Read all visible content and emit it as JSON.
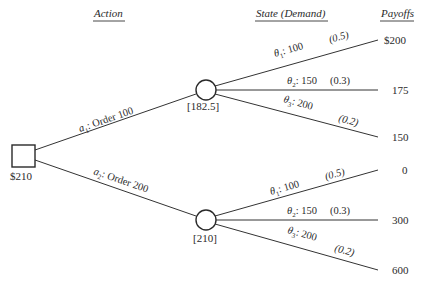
{
  "headers": {
    "action": "Action",
    "state": "State (Demand)",
    "payoffs": "Payoffs"
  },
  "decision_node": {
    "value": "$210"
  },
  "actions": [
    {
      "symbol": "a",
      "subscript": "1",
      "label": ": Order 100",
      "expected_value": "[182.5]",
      "states": [
        {
          "symbol": "θ",
          "subscript": "1",
          "demand": ": 100",
          "prob": "(0.5)",
          "payoff": "$200"
        },
        {
          "symbol": "θ",
          "subscript": "2",
          "demand": ": 150",
          "prob": "(0.3)",
          "payoff": "175"
        },
        {
          "symbol": "θ",
          "subscript": "3",
          "demand": ": 200",
          "prob": "(0.2)",
          "payoff": "150"
        }
      ]
    },
    {
      "symbol": "a",
      "subscript": "2",
      "label": ": Order 200",
      "expected_value": "[210]",
      "states": [
        {
          "symbol": "θ",
          "subscript": "1",
          "demand": ": 100",
          "prob": "(0.5)",
          "payoff": "0"
        },
        {
          "symbol": "θ",
          "subscript": "2",
          "demand": ": 150",
          "prob": "(0.3)",
          "payoff": "300"
        },
        {
          "symbol": "θ",
          "subscript": "3",
          "demand": ": 200",
          "prob": "(0.2)",
          "payoff": "600"
        }
      ]
    }
  ]
}
